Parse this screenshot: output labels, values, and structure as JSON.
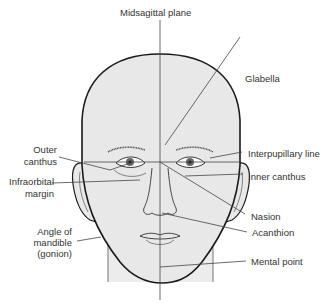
{
  "diagram": {
    "type": "anatomical-face-landmarks",
    "labels": {
      "midsagittal_plane": "Midsagittal plane",
      "glabella": "Glabella",
      "outer_canthus_1": "Outer",
      "outer_canthus_2": "canthus",
      "interpupillary_line": "Interpupillary line",
      "infraorbital_margin_1": "Infraorbital",
      "infraorbital_margin_2": "margin",
      "inner_canthus": "Inner canthus",
      "nasion": "Nasion",
      "acanthion": "Acanthion",
      "angle_of_mandible_1": "Angle of",
      "angle_of_mandible_2": "mandible",
      "angle_of_mandible_3": "(gonion)",
      "mental_point": "Mental point"
    },
    "colors": {
      "skin": "#e8e8e8",
      "outline": "#1a1a1a",
      "line": "#333333",
      "text": "#333333"
    }
  }
}
